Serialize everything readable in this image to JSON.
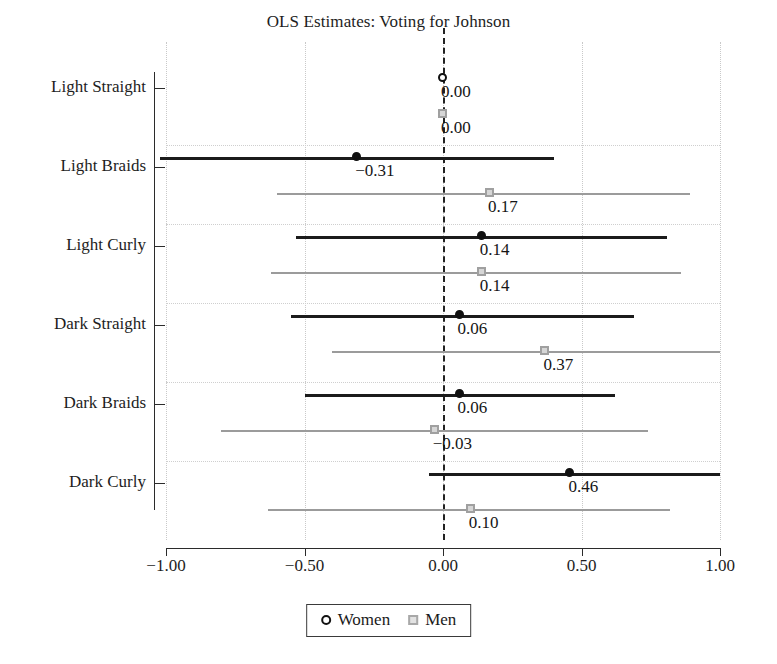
{
  "chart_data": {
    "type": "scatter",
    "title": "OLS Estimates: Voting for Johnson",
    "xlabel": "",
    "ylabel": "",
    "xlim": [
      -1.0,
      1.0
    ],
    "xticks": [
      -1.0,
      -0.5,
      0.0,
      0.5,
      1.0
    ],
    "xtick_labels": [
      "−1.00",
      "−0.50",
      "0.00",
      "0.50",
      "1.00"
    ],
    "categories": [
      "Light Straight",
      "Light Braids",
      "Light Curly",
      "Dark Straight",
      "Dark Braids",
      "Dark Curly"
    ],
    "grid": true,
    "reference_line": 0.0,
    "legend_position": "bottom",
    "series": [
      {
        "name": "Women",
        "marker": "circle",
        "color": "#111111",
        "values": [
          0.0,
          -0.31,
          0.14,
          0.06,
          0.06,
          0.46
        ],
        "labels": [
          "0.00",
          "−0.31",
          "0.14",
          "0.06",
          "0.06",
          "0.46"
        ],
        "ci_low": [
          0.0,
          -1.02,
          -0.53,
          -0.55,
          -0.5,
          -0.05
        ],
        "ci_high": [
          0.0,
          0.4,
          0.81,
          0.69,
          0.62,
          1.0
        ]
      },
      {
        "name": "Men",
        "marker": "square",
        "color": "#a0a0a0",
        "values": [
          0.0,
          0.17,
          0.14,
          0.37,
          -0.03,
          0.1
        ],
        "labels": [
          "0.00",
          "0.17",
          "0.14",
          "0.37",
          "−0.03",
          "0.10"
        ],
        "ci_low": [
          0.0,
          -0.6,
          -0.62,
          -0.4,
          -0.8,
          -0.63
        ],
        "ci_high": [
          0.0,
          0.89,
          0.86,
          1.0,
          0.74,
          0.82
        ]
      }
    ]
  },
  "legend": {
    "women_label": "Women",
    "men_label": "Men"
  }
}
